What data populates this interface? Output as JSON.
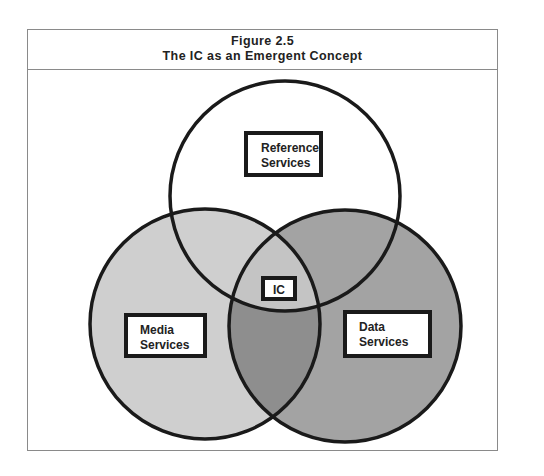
{
  "figure": {
    "number": "Figure 2.5",
    "title": "The IC as an Emergent Concept"
  },
  "diagram": {
    "type": "venn",
    "sets": [
      {
        "label_line1": "Reference",
        "label_line2": "Services",
        "fill": "#ffffff"
      },
      {
        "label_line1": "Media",
        "label_line2": "Services",
        "fill": "#cfcfcf"
      },
      {
        "label_line1": "Data",
        "label_line2": "Services",
        "fill": "#a3a3a3"
      }
    ],
    "intersection_label": "IC",
    "colors": {
      "outline": "#1a1a1a",
      "media_only": "#cfcfcf",
      "data_only": "#a3a3a3",
      "media_data_overlap": "#8e8e8e",
      "center": "#c4c4c4",
      "reference_data_overlap": "#a3a3a3",
      "reference_media_overlap": "#cfcfcf"
    }
  }
}
